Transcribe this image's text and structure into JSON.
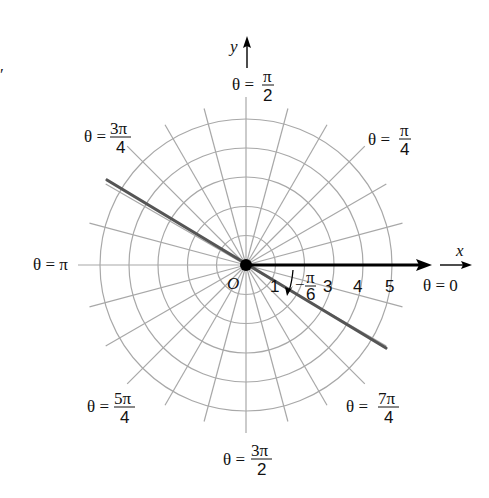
{
  "diagram": {
    "type": "polar-coordinate-grid",
    "center_label": "O",
    "axis_labels": {
      "x": "x",
      "y": "y"
    },
    "radial_tick_labels": [
      "1",
      "3",
      "4",
      "5"
    ],
    "ring_count": 5,
    "ray_step_degrees": 15,
    "angle_labels": [
      {
        "id": "theta-0",
        "theta": "θ = 0",
        "num": "",
        "den": "",
        "angle_deg": 0
      },
      {
        "id": "theta-pi-4",
        "theta": "θ =",
        "num": "π",
        "den": "4",
        "angle_deg": 45
      },
      {
        "id": "theta-pi-2",
        "theta": "θ =",
        "num": "π",
        "den": "2",
        "angle_deg": 90
      },
      {
        "id": "theta-3pi-4",
        "theta": "θ =",
        "num": "3π",
        "den": "4",
        "angle_deg": 135
      },
      {
        "id": "theta-pi",
        "theta": "θ = π",
        "num": "",
        "den": "",
        "angle_deg": 180
      },
      {
        "id": "theta-5pi-4",
        "theta": "θ =",
        "num": "5π",
        "den": "4",
        "angle_deg": 225
      },
      {
        "id": "theta-3pi-2",
        "theta": "θ =",
        "num": "3π",
        "den": "2",
        "angle_deg": 270
      },
      {
        "id": "theta-7pi-4",
        "theta": "θ =",
        "num": "7π",
        "den": "4",
        "angle_deg": 315
      }
    ],
    "highlighted_angle": {
      "sign": "−",
      "num": "π",
      "den": "6",
      "angle_deg": -30
    },
    "colors": {
      "grid": "#a8a8a8",
      "line": "#555555",
      "axis": "#000000",
      "text": "#111111"
    }
  }
}
